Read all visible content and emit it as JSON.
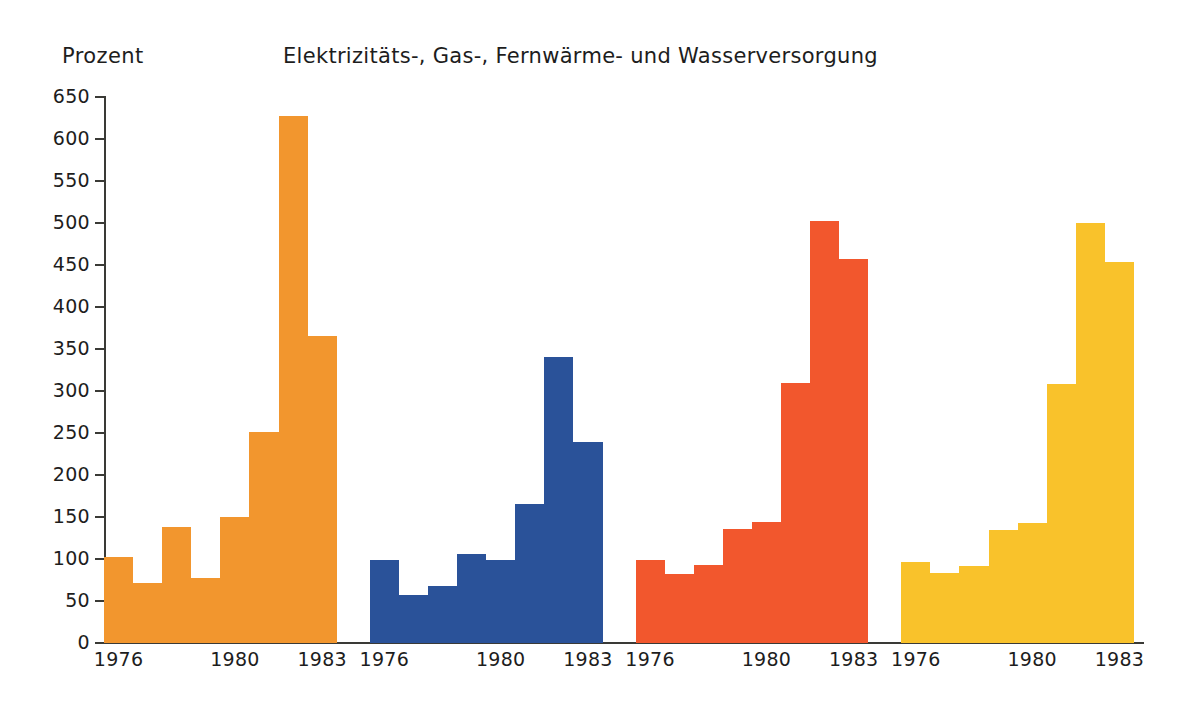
{
  "chart_data": {
    "type": "bar",
    "title": "Elektrizitäts-, Gas-, Fernwärme- und Wasserversorgung",
    "ylabel": "Prozent",
    "xlabel": "",
    "ylim": [
      0,
      650
    ],
    "ytick_step": 50,
    "yticks": [
      "0",
      "50",
      "100",
      "150",
      "200",
      "250",
      "300",
      "350",
      "400",
      "450",
      "500",
      "550",
      "600",
      "650"
    ],
    "grid": false,
    "legend": "none",
    "categories": [
      "1976",
      "1977",
      "1978",
      "1979",
      "1980",
      "1981",
      "1982",
      "1983"
    ],
    "xtick_labels": [
      "1976",
      "1980",
      "1983"
    ],
    "xtick_categories": [
      "1976",
      "1980",
      "1983"
    ],
    "panels": [
      {
        "name": "panel-1",
        "color": "#F2962E",
        "values": [
          102,
          72,
          138,
          77,
          150,
          251,
          627,
          365
        ]
      },
      {
        "name": "panel-2",
        "color": "#2A5299",
        "values": [
          99,
          57,
          68,
          106,
          99,
          165,
          340,
          239
        ]
      },
      {
        "name": "panel-3",
        "color": "#F2572D",
        "values": [
          99,
          82,
          93,
          136,
          144,
          309,
          502,
          457
        ]
      },
      {
        "name": "panel-4",
        "color": "#F9C22B",
        "values": [
          97,
          83,
          92,
          135,
          143,
          308,
          500,
          454
        ]
      }
    ]
  },
  "colors": {
    "background": "#FFFFFF",
    "axis": "#3A3A36",
    "text": "#1D1D1D",
    "orange": "#F2962E",
    "blue": "#2A5299",
    "red": "#F2572D",
    "yellow": "#F9C22B"
  }
}
